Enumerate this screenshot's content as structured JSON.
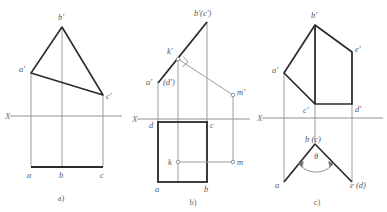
{
  "page": {
    "background_color": "#ffffff",
    "width": 387,
    "height": 212
  },
  "style": {
    "heavy_line_color": "#2b2b2b",
    "light_line_color": "#9a9ea1",
    "axis_line_color": "#8f9396",
    "label_color": "#55595c",
    "caption_color": "#6a6e71"
  },
  "figures": [
    {
      "id": "figure-a",
      "caption": "a)",
      "axis_label": "X",
      "description": "Frontal projection triangle a'b'c' above the X axis with horizontal projection line abc below",
      "vertex_labels": {
        "a_prime": "a'",
        "b_prime": "b'",
        "c_prime": "c'",
        "a": "a",
        "b": "b",
        "c": "c"
      }
    },
    {
      "id": "figure-b",
      "caption": "b)",
      "axis_label": "X",
      "description": "Edge-view plane with square horizontal projection abcd and point K, M projections",
      "vertex_labels": {
        "a_prime": "a'",
        "b_prime_c_prime": "b'(c')",
        "d_prime": "(d')",
        "k_prime": "k'",
        "m_prime": "m'",
        "a": "a",
        "b": "b",
        "c": "c",
        "d": "d",
        "k": "k",
        "m": "m"
      },
      "markers": {
        "right_angle": "right-angle-marker"
      }
    },
    {
      "id": "figure-c",
      "caption": "c)",
      "axis_label": "X",
      "description": "Frontal projection pentagon a'b'e'd'c' with horizontal projection showing dihedral angle theta",
      "vertex_labels": {
        "a_prime": "a'",
        "b_prime": "b'",
        "c_prime": "c'",
        "d_prime": "d'",
        "e_prime": "e'",
        "a": "a",
        "b_c": "b (c)",
        "e_d": "e (d)"
      },
      "angle_label": "θ"
    }
  ]
}
